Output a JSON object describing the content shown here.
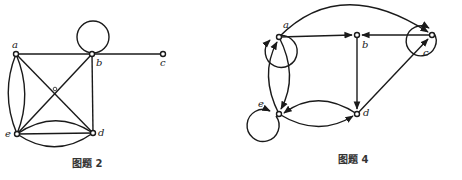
{
  "figures": [
    {
      "caption": "图题 2",
      "directed": false,
      "nodes": [
        {
          "id": "a",
          "label": "a"
        },
        {
          "id": "b",
          "label": "b"
        },
        {
          "id": "c",
          "label": "c"
        },
        {
          "id": "d",
          "label": "d"
        },
        {
          "id": "e",
          "label": "e"
        }
      ],
      "edges": [
        {
          "from": "a",
          "to": "b"
        },
        {
          "from": "b",
          "to": "b",
          "type": "loop"
        },
        {
          "from": "b",
          "to": "c"
        },
        {
          "from": "b",
          "to": "d"
        },
        {
          "from": "a",
          "to": "d"
        },
        {
          "from": "b",
          "to": "e"
        },
        {
          "from": "a",
          "to": "e",
          "type": "arc-left"
        },
        {
          "from": "a",
          "to": "e",
          "type": "arc-right"
        },
        {
          "from": "e",
          "to": "d",
          "type": "arc-upper"
        },
        {
          "from": "e",
          "to": "d",
          "type": "straight"
        },
        {
          "from": "e",
          "to": "d",
          "type": "arc-lower"
        }
      ]
    },
    {
      "caption": "图题 4",
      "directed": true,
      "nodes": [
        {
          "id": "a",
          "label": "a"
        },
        {
          "id": "b",
          "label": "b"
        },
        {
          "id": "c",
          "label": "c"
        },
        {
          "id": "d",
          "label": "d"
        },
        {
          "id": "e",
          "label": "e"
        }
      ],
      "edges": [
        {
          "from": "a",
          "to": "a",
          "type": "loop"
        },
        {
          "from": "c",
          "to": "c",
          "type": "loop"
        },
        {
          "from": "e",
          "to": "e",
          "type": "loop"
        },
        {
          "from": "a",
          "to": "b"
        },
        {
          "from": "c",
          "to": "b"
        },
        {
          "from": "a",
          "to": "c",
          "type": "arc"
        },
        {
          "from": "b",
          "to": "d"
        },
        {
          "from": "d",
          "to": "c"
        },
        {
          "from": "a",
          "to": "e",
          "type": "arc"
        },
        {
          "from": "e",
          "to": "a",
          "type": "arc"
        },
        {
          "from": "e",
          "to": "d",
          "type": "arc-lower"
        },
        {
          "from": "d",
          "to": "e",
          "type": "arc-upper"
        }
      ]
    }
  ]
}
